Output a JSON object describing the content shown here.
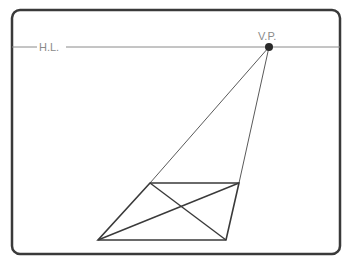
{
  "diagram": {
    "labels": {
      "horizon_line": "H.L.",
      "vanishing_point": "V.P."
    },
    "colors": {
      "frame": "#3a3a3a",
      "horizon": "#8a8a8a",
      "shape": "#3a3a3a",
      "label": "#8a8a8a",
      "vp_dot": "#2a2a2a"
    },
    "points": {
      "vanishing_point": [
        269,
        47
      ],
      "far_left": [
        150,
        183
      ],
      "far_right": [
        239,
        183
      ],
      "near_left": [
        98,
        240
      ],
      "near_right": [
        226,
        240
      ]
    }
  }
}
